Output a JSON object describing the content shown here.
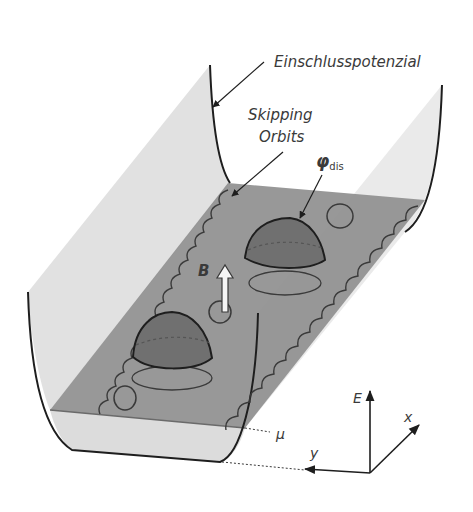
{
  "figure": {
    "labels": {
      "confinement": "Einschlusspotenzial",
      "skipping_line1": "Skipping",
      "skipping_line2": "Orbits",
      "phi_main": "φ",
      "phi_sub": "dis",
      "field": "B",
      "chemical_potential": "μ"
    },
    "axes": {
      "E": "E",
      "x": "x",
      "y": "y"
    },
    "colors": {
      "background": "#ffffff",
      "wall": "#d9d9d9",
      "floor": "#8f8f8f",
      "below_mu": "#e2e2e2",
      "hill": "#6e6e6e",
      "line": "#1e1e1e",
      "orbit": "#3a3a3a",
      "text": "#3a3a3a"
    }
  }
}
